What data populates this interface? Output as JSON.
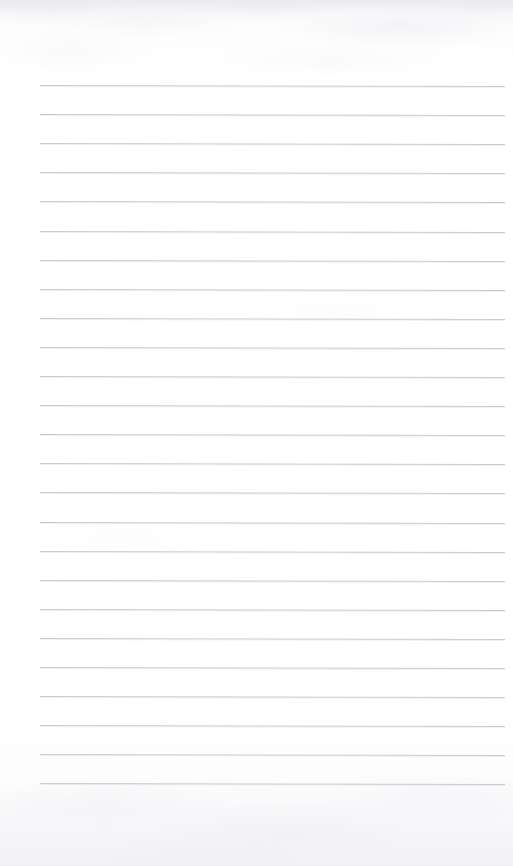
{
  "document": {
    "kind": "scanned-lined-notebook-page",
    "title": "Blank Lined Paper",
    "orientation": "portrait",
    "page_width_px": 513,
    "page_height_px": 866,
    "content_text": "",
    "has_handwriting": false,
    "has_printed_text": false
  },
  "paper": {
    "background_color": "#ffffff",
    "tint_color": "#fbfbfc",
    "texture_description": "faint mottled scanner noise along the top and bottom edges",
    "edge_shadow_color": "#e5e5eb"
  },
  "ruling": {
    "style": "wide-ruled horizontal lines",
    "line_color": "#c9c9cd",
    "line_halo_color": "#d2d2d8",
    "line_thickness_px": 1,
    "line_count": 25,
    "line_spacing_px": 29.1,
    "first_line_y_px": 85,
    "last_line_y_px": 784,
    "line_start_x_px": 40,
    "line_end_x_px": 505,
    "line_length_px": 465,
    "slant_deg": 0.12,
    "left_margin_px": 40,
    "right_margin_px": 8,
    "top_margin_px": 85,
    "bottom_margin_px": 82,
    "has_vertical_margin_rule": false,
    "lines_y_px": [
      85,
      114.1,
      143.2,
      172.3,
      201.4,
      230.5,
      259.6,
      288.7,
      317.8,
      346.9,
      376,
      405.1,
      434.2,
      463.3,
      492.4,
      521.5,
      550.6,
      579.7,
      608.8,
      637.9,
      667,
      696.1,
      725.2,
      754.3,
      783.4
    ]
  },
  "regions": {
    "top_margin_label": "top margin",
    "left_margin_label": "left margin",
    "right_margin_label": "right margin",
    "bottom_margin_label": "bottom margin",
    "writing_area_label": "writing area"
  }
}
